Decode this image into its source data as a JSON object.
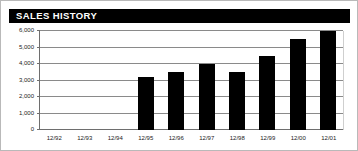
{
  "header": {
    "title": "SALES HISTORY",
    "banner_color": "#000000",
    "title_color": "#ffffff"
  },
  "chart_data": {
    "type": "bar",
    "title": "SALES HISTORY",
    "xlabel": "",
    "ylabel": "",
    "categories": [
      "12/92",
      "12/93",
      "12/94",
      "12/95",
      "12/96",
      "12/97",
      "12/98",
      "12/99",
      "12/00",
      "12/01"
    ],
    "values": [
      0,
      0,
      0,
      3200,
      3500,
      4000,
      3500,
      4500,
      5500,
      6000
    ],
    "ylim": [
      0,
      6000
    ],
    "ytick_values": [
      0,
      1000,
      2000,
      3000,
      4000,
      5000,
      6000
    ],
    "ytick_labels": [
      "0",
      "1,000",
      "2,000",
      "3,000",
      "4,000",
      "5,000",
      "6,000"
    ],
    "grid": true,
    "legend": "none",
    "bar_color": "#000000",
    "gridline_color": "#8a8a8a",
    "axis_color": "#6e6e6e"
  }
}
